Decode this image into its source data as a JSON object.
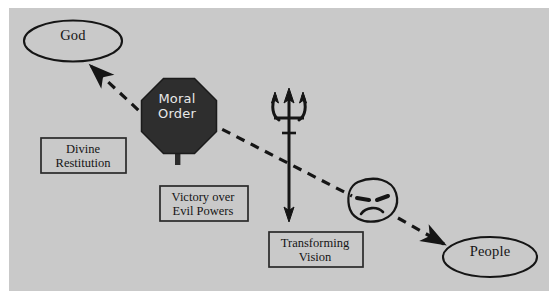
{
  "diagram": {
    "background_color": "#c9c9c9",
    "page_color": "#ffffff",
    "ink_color": "#151515",
    "sign_fill": "#2e2e2e",
    "sign_text_color": "#e8e8e8",
    "nodes": [
      {
        "id": "god",
        "shape": "ellipse",
        "label": "God",
        "name": "god-node"
      },
      {
        "id": "people",
        "shape": "ellipse",
        "label": "People",
        "name": "people-node"
      },
      {
        "id": "moral-order",
        "shape": "octagon-stop-sign",
        "label_line1": "Moral",
        "label_line2": "Order",
        "name": "moral-order-sign"
      },
      {
        "id": "divine-restitution",
        "shape": "rectangle",
        "label_line1": "Divine",
        "label_line2": "Restitution",
        "name": "divine-restitution-box"
      },
      {
        "id": "victory-over-evil-powers",
        "shape": "rectangle",
        "label_line1": "Victory over",
        "label_line2": "Evil Powers",
        "name": "victory-over-evil-powers-box"
      },
      {
        "id": "transforming-vision",
        "shape": "rectangle",
        "label_line1": "Transforming",
        "label_line2": "Vision",
        "name": "transforming-vision-box"
      }
    ],
    "icons": [
      {
        "id": "trident",
        "name": "trident-double-arrow-icon",
        "description": "Vertical trident with arrowheads at both ends"
      },
      {
        "id": "frowning-face",
        "name": "frowning-face-icon",
        "description": "Round face with slanted eyes and downturned mouth"
      }
    ],
    "connectors": [
      {
        "id": "moral-order-to-god",
        "name": "dashed-arrow-to-god",
        "style": "dashed",
        "arrowhead": "end",
        "from": "moral-order",
        "to": "god"
      },
      {
        "id": "moral-order-to-people",
        "name": "dashed-arrow-to-people",
        "style": "dashed",
        "arrowhead": "end",
        "from": "moral-order",
        "to": "people"
      }
    ]
  }
}
